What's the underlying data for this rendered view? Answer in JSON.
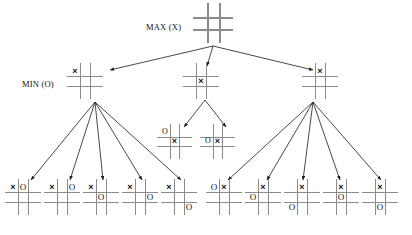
{
  "diagram": {
    "labels": {
      "max": "MAX (X)",
      "min": "MIN (O)"
    },
    "colors": {
      "grid_light": "#8b8b8b",
      "grid_dark": "#1a1a1a",
      "mark": "#111111",
      "edge": "#1a1a1a",
      "background": "#ffffff"
    },
    "marks": {
      "x": "×",
      "o": "O"
    }
  },
  "nodes": [
    {
      "id": "root",
      "level": 0,
      "role": "MAX",
      "x": 196,
      "y": 6,
      "size": 34,
      "cells": [
        "",
        "",
        "",
        "",
        "",
        "",
        "",
        "",
        ""
      ]
    },
    {
      "id": "min-left",
      "level": 1,
      "role": "MIN",
      "x": 70,
      "y": 66,
      "size": 30,
      "cells": [
        "X",
        "",
        "",
        "",
        "",
        "",
        "",
        "",
        ""
      ]
    },
    {
      "id": "min-center",
      "level": 1,
      "role": "MIN",
      "x": 186,
      "y": 66,
      "size": 30,
      "cells": [
        "",
        "",
        "",
        "",
        "X",
        "",
        "",
        "",
        ""
      ]
    },
    {
      "id": "min-right",
      "level": 1,
      "role": "MIN",
      "x": 305,
      "y": 66,
      "size": 30,
      "cells": [
        "",
        "X",
        "",
        "",
        "",
        "",
        "",
        "",
        ""
      ]
    },
    {
      "id": "mid-child-1",
      "level": 2,
      "role": "MAX",
      "x": 160,
      "y": 127,
      "size": 29,
      "cells": [
        "O",
        "",
        "",
        "",
        "X",
        "",
        "",
        "",
        ""
      ]
    },
    {
      "id": "mid-child-2",
      "level": 2,
      "role": "MAX",
      "x": 203,
      "y": 127,
      "size": 29,
      "cells": [
        "",
        "",
        "",
        "O",
        "X",
        "",
        "",
        "",
        ""
      ]
    },
    {
      "id": "leaf-1",
      "level": 2,
      "role": "MAX",
      "x": 8,
      "y": 182,
      "size": 30,
      "cells": [
        "X",
        "O",
        "",
        "",
        "",
        "",
        "",
        "",
        ""
      ]
    },
    {
      "id": "leaf-2",
      "level": 2,
      "role": "MAX",
      "x": 47,
      "y": 182,
      "size": 30,
      "cells": [
        "X",
        "",
        "O",
        "",
        "",
        "",
        "",
        "",
        ""
      ]
    },
    {
      "id": "leaf-3",
      "level": 2,
      "role": "MAX",
      "x": 86,
      "y": 182,
      "size": 30,
      "cells": [
        "X",
        "",
        "",
        "",
        "O",
        "",
        "",
        "",
        ""
      ]
    },
    {
      "id": "leaf-4",
      "level": 2,
      "role": "MAX",
      "x": 125,
      "y": 182,
      "size": 30,
      "cells": [
        "X",
        "",
        "",
        "",
        "",
        "O",
        "",
        "",
        ""
      ]
    },
    {
      "id": "leaf-5",
      "level": 2,
      "role": "MAX",
      "x": 164,
      "y": 182,
      "size": 30,
      "cells": [
        "X",
        "",
        "",
        "",
        "",
        "",
        "",
        "",
        "O"
      ]
    },
    {
      "id": "leaf-6",
      "level": 2,
      "role": "MAX",
      "x": 209,
      "y": 182,
      "size": 30,
      "cells": [
        "O",
        "X",
        "",
        "",
        "",
        "",
        "",
        "",
        ""
      ]
    },
    {
      "id": "leaf-7",
      "level": 2,
      "role": "MAX",
      "x": 248,
      "y": 182,
      "size": 30,
      "cells": [
        "",
        "X",
        "",
        "O",
        "",
        "",
        "",
        "",
        ""
      ]
    },
    {
      "id": "leaf-8",
      "level": 2,
      "role": "MAX",
      "x": 287,
      "y": 182,
      "size": 30,
      "cells": [
        "",
        "X",
        "",
        "",
        "",
        "",
        "O",
        "",
        ""
      ]
    },
    {
      "id": "leaf-9",
      "level": 2,
      "role": "MAX",
      "x": 326,
      "y": 182,
      "size": 30,
      "cells": [
        "",
        "X",
        "",
        "",
        "O",
        "",
        "",
        "",
        ""
      ]
    },
    {
      "id": "leaf-10",
      "level": 2,
      "role": "MAX",
      "x": 365,
      "y": 182,
      "size": 30,
      "cells": [
        "",
        "X",
        "",
        "",
        "",
        "",
        "",
        "O",
        ""
      ]
    }
  ],
  "edges": [
    {
      "from": "root",
      "to": "min-left",
      "x1": 213,
      "y1": 46,
      "x2": 110,
      "y2": 70
    },
    {
      "from": "root",
      "to": "min-center",
      "x1": 213,
      "y1": 46,
      "x2": 207,
      "y2": 66
    },
    {
      "from": "root",
      "to": "min-right",
      "x1": 213,
      "y1": 46,
      "x2": 313,
      "y2": 70
    },
    {
      "from": "min-center",
      "to": "mid-child-1",
      "x1": 205,
      "y1": 100,
      "x2": 184,
      "y2": 127
    },
    {
      "from": "min-center",
      "to": "mid-child-2",
      "x1": 205,
      "y1": 100,
      "x2": 226,
      "y2": 127
    },
    {
      "from": "min-left",
      "to": "leaf-1",
      "x1": 95,
      "y1": 102,
      "x2": 31,
      "y2": 180
    },
    {
      "from": "min-left",
      "to": "leaf-2",
      "x1": 95,
      "y1": 102,
      "x2": 70,
      "y2": 180
    },
    {
      "from": "min-left",
      "to": "leaf-3",
      "x1": 95,
      "y1": 102,
      "x2": 103,
      "y2": 180
    },
    {
      "from": "min-left",
      "to": "leaf-4",
      "x1": 95,
      "y1": 102,
      "x2": 142,
      "y2": 180
    },
    {
      "from": "min-left",
      "to": "leaf-5",
      "x1": 95,
      "y1": 102,
      "x2": 181,
      "y2": 180
    },
    {
      "from": "min-right",
      "to": "leaf-6",
      "x1": 313,
      "y1": 102,
      "x2": 228,
      "y2": 180
    },
    {
      "from": "min-right",
      "to": "leaf-7",
      "x1": 313,
      "y1": 102,
      "x2": 267,
      "y2": 180
    },
    {
      "from": "min-right",
      "to": "leaf-8",
      "x1": 313,
      "y1": 102,
      "x2": 303,
      "y2": 180
    },
    {
      "from": "min-right",
      "to": "leaf-9",
      "x1": 313,
      "y1": 102,
      "x2": 340,
      "y2": 180
    },
    {
      "from": "min-right",
      "to": "leaf-10",
      "x1": 313,
      "y1": 102,
      "x2": 381,
      "y2": 180
    }
  ]
}
